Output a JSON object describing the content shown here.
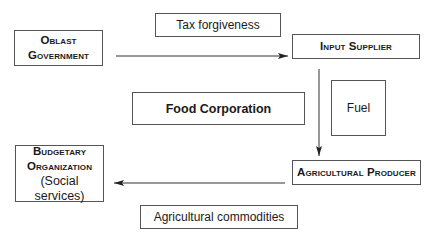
{
  "diagram": {
    "nodes": {
      "oblast_government": {
        "line1": "Oblast",
        "line2": "Government"
      },
      "input_supplier": {
        "label": "Input Supplier"
      },
      "food_corporation": {
        "label": "Food Corporation"
      },
      "fuel": {
        "label": "Fuel"
      },
      "budgetary_organization": {
        "line1": "Budgetary",
        "line2": "Organization",
        "line3": "(Social services)"
      },
      "agricultural_producer": {
        "label": "Agricultural Producer"
      }
    },
    "flow_labels": {
      "tax_forgiveness": "Tax forgiveness",
      "agricultural_commodities": "Agricultural commodities"
    },
    "edges": [
      {
        "from": "oblast_government",
        "to": "input_supplier",
        "label": "Tax forgiveness"
      },
      {
        "from": "input_supplier",
        "to": "agricultural_producer",
        "label": "Fuel"
      },
      {
        "from": "agricultural_producer",
        "to": "budgetary_organization",
        "label": "Agricultural commodities"
      }
    ],
    "colors": {
      "line": "#333333",
      "border": "#555555",
      "background": "#ffffff"
    }
  }
}
